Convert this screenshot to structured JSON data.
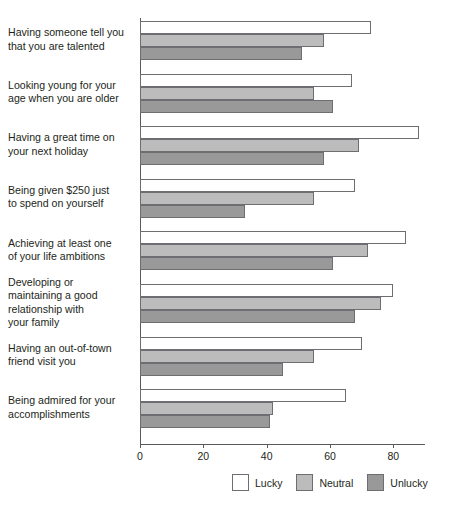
{
  "chart_data": {
    "type": "bar",
    "orientation": "horizontal",
    "title": "",
    "subtitle": "",
    "xlabel": "",
    "ylabel": "",
    "xlim": [
      0,
      90
    ],
    "xticks": [
      0,
      20,
      40,
      60,
      80
    ],
    "xtick_labels": [
      "0",
      "20",
      "40",
      "60",
      "80"
    ],
    "grid": false,
    "legend_position": "bottom-right",
    "categories": [
      "Having someone tell you that you are talented",
      "Looking young for your age when you are older",
      "Having a great time on your next holiday",
      "Being given $250 just to spend on yourself",
      "Achieving at least one of your life ambitions",
      "Developing or maintaining a good relationship with your family",
      "Having an out-of-town friend visit you",
      "Being admired for your accomplishments"
    ],
    "category_lines": [
      [
        "Having someone tell you",
        "that you are talented"
      ],
      [
        "Looking young for your",
        "age when you are older"
      ],
      [
        "Having a great time on",
        "your next holiday"
      ],
      [
        "Being given $250 just",
        "to spend on yourself"
      ],
      [
        "Achieving at least one",
        "of your life ambitions"
      ],
      [
        "Developing or",
        "maintaining a good",
        "relationship with",
        "your family"
      ],
      [
        "Having an out-of-town",
        "friend visit you"
      ],
      [
        "Being admired for your",
        "accomplishments"
      ]
    ],
    "series": [
      {
        "name": "Lucky",
        "color": "#ffffff",
        "values": [
          73,
          67,
          88,
          68,
          84,
          80,
          70,
          65
        ]
      },
      {
        "name": "Neutral",
        "color": "#bcbcbc",
        "values": [
          58,
          55,
          69,
          55,
          72,
          76,
          55,
          42
        ]
      },
      {
        "name": "Unlucky",
        "color": "#999999",
        "values": [
          51,
          61,
          58,
          33,
          61,
          68,
          45,
          41
        ]
      }
    ]
  },
  "legend": {
    "items": [
      {
        "label": "Lucky",
        "key": "lucky"
      },
      {
        "label": "Neutral",
        "key": "neutral"
      },
      {
        "label": "Unlucky",
        "key": "unlucky"
      }
    ]
  },
  "colors": {
    "axis": "#58595b",
    "bar_outline": "#6d6e71",
    "lucky": "#ffffff",
    "neutral": "#bcbcbc",
    "unlucky": "#999999",
    "text": "#231f20"
  }
}
